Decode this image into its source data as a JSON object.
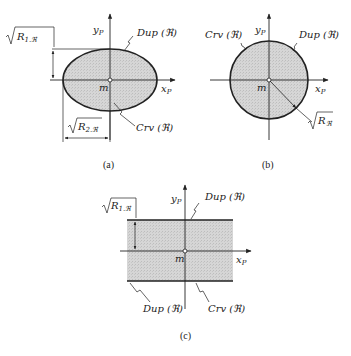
{
  "colors": {
    "stroke": "#222222",
    "fill": "#d4d4d4",
    "background": "#ffffff"
  },
  "panels": [
    {
      "id": "a",
      "caption": "(a)",
      "shape": "ellipse",
      "origin_label": "m",
      "x_axis_label": "x",
      "x_axis_sub": "P",
      "y_axis_label": "y",
      "y_axis_sub": "P",
      "boundary_labels": {
        "dup": "Dup (ℜ)",
        "crv": "Crv (ℜ)"
      },
      "dim_vertical": {
        "main": "R",
        "sub": "1.ℜ"
      },
      "dim_horizontal": {
        "main": "R",
        "sub": "2.ℜ"
      }
    },
    {
      "id": "b",
      "caption": "(b)",
      "shape": "circle",
      "origin_label": "m",
      "x_axis_label": "x",
      "x_axis_sub": "P",
      "y_axis_label": "y",
      "y_axis_sub": "P",
      "boundary_labels": {
        "crv": "Crv (ℜ)",
        "dup": "Dup (ℜ)"
      },
      "dim_radius": {
        "main": "R",
        "sub": "ℜ"
      }
    },
    {
      "id": "c",
      "caption": "(c)",
      "shape": "band",
      "origin_label": "m",
      "x_axis_label": "x",
      "x_axis_sub": "P",
      "y_axis_label": "y",
      "y_axis_sub": "P",
      "boundary_labels": {
        "dup_top": "Dup (ℜ)",
        "dup_bottom": "Dup (ℜ)",
        "crv": "Crv (ℜ)"
      },
      "dim_vertical": {
        "main": "R",
        "sub": "1.ℜ"
      }
    }
  ]
}
